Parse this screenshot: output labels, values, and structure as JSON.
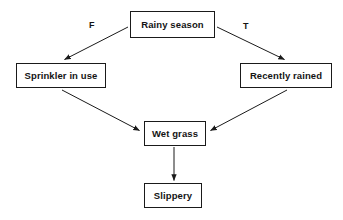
{
  "diagram": {
    "type": "directed-graph",
    "background_color": "#ffffff",
    "stroke_color": "#1a1a1a",
    "text_color": "#141414",
    "nodes": [
      {
        "id": "rainy-season",
        "label": "Rainy season",
        "x": 130,
        "y": 11,
        "width": 85,
        "height": 27
      },
      {
        "id": "sprinkler",
        "label": "Sprinkler in use",
        "x": 16,
        "y": 63,
        "width": 90,
        "height": 25
      },
      {
        "id": "recently-rained",
        "label": "Recently rained",
        "x": 240,
        "y": 63,
        "width": 92,
        "height": 25
      },
      {
        "id": "wet-grass",
        "label": "Wet grass",
        "x": 144,
        "y": 121,
        "width": 62,
        "height": 25
      },
      {
        "id": "slippery",
        "label": "Slippery",
        "x": 144,
        "y": 183,
        "width": 58,
        "height": 25
      }
    ],
    "edges": [
      {
        "id": "rainy-to-sprinkler",
        "from": "rainy-season",
        "to": "sprinkler",
        "label": "F"
      },
      {
        "id": "rainy-to-rained",
        "from": "rainy-season",
        "to": "recently-rained",
        "label": "T"
      },
      {
        "id": "sprinkler-to-grass",
        "from": "sprinkler",
        "to": "wet-grass",
        "label": ""
      },
      {
        "id": "rained-to-grass",
        "from": "recently-rained",
        "to": "wet-grass",
        "label": ""
      },
      {
        "id": "grass-to-slippery",
        "from": "wet-grass",
        "to": "slippery",
        "label": ""
      }
    ],
    "edge_labels": {
      "false_branch": "F",
      "true_branch": "T"
    }
  }
}
